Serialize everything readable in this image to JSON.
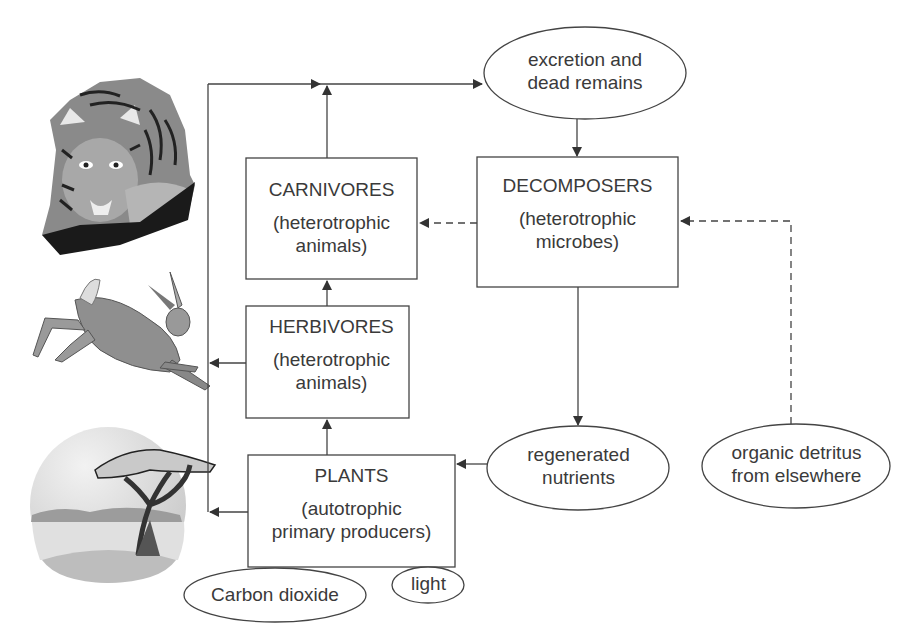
{
  "diagram": {
    "type": "food web / ecosystem nutrient cycle",
    "colors": {
      "line": "#444444",
      "text": "#3a3a3a",
      "background": "#ffffff"
    },
    "illustrations": [
      {
        "id": "tiger",
        "icon": "tiger-illustration"
      },
      {
        "id": "hare",
        "icon": "hare-illustration"
      },
      {
        "id": "acacia",
        "icon": "acacia-tree-landscape-illustration"
      }
    ],
    "boxes": {
      "carnivores": {
        "title": "CARNIVORES",
        "sub1": "(heterotrophic",
        "sub2": "animals)"
      },
      "herbivores": {
        "title": "HERBIVORES",
        "sub1": "(heterotrophic",
        "sub2": "animals)"
      },
      "plants": {
        "title": "PLANTS",
        "sub1": "(autotrophic",
        "sub2": "primary producers)"
      },
      "decomposers": {
        "title": "DECOMPOSERS",
        "sub1": "(heterotrophic",
        "sub2": "microbes)"
      }
    },
    "ellipses": {
      "excretion": {
        "line1": "excretion and",
        "line2": "dead remains"
      },
      "regenerated": {
        "line1": "regenerated",
        "line2": "nutrients"
      },
      "detritus": {
        "line1": "organic detritus",
        "line2": "from elsewhere"
      },
      "co2": {
        "line1": "Carbon dioxide"
      },
      "light": {
        "line1": "light"
      }
    },
    "edges": [
      {
        "from": "plants",
        "to": "herbivores",
        "style": "solid"
      },
      {
        "from": "herbivores",
        "to": "carnivores",
        "style": "solid"
      },
      {
        "from": "carnivores",
        "to": "excretion",
        "style": "solid"
      },
      {
        "from": "plants",
        "to": "excretion",
        "style": "solid",
        "via": "left bus"
      },
      {
        "from": "herbivores",
        "to": "excretion",
        "style": "solid",
        "via": "left bus"
      },
      {
        "from": "excretion",
        "to": "decomposers",
        "style": "solid"
      },
      {
        "from": "decomposers",
        "to": "carnivores",
        "style": "dashed"
      },
      {
        "from": "decomposers",
        "to": "regenerated",
        "style": "solid"
      },
      {
        "from": "regenerated",
        "to": "plants",
        "style": "solid"
      },
      {
        "from": "detritus",
        "to": "decomposers",
        "style": "dashed"
      }
    ]
  }
}
